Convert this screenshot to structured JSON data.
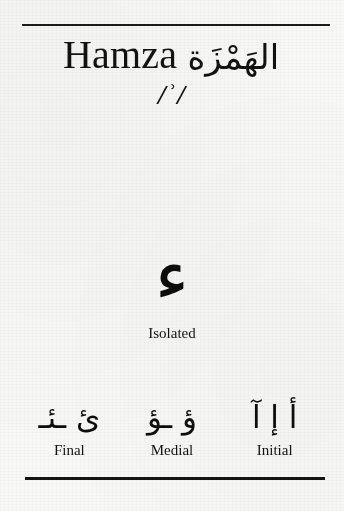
{
  "header": {
    "title_latin": "Hamza",
    "title_arabic": "الهَمْزَة",
    "phonetic": "/ʾ/"
  },
  "isolated": {
    "glyph": "ء",
    "label": "Isolated"
  },
  "forms": [
    {
      "glyphs": "ئ ـئـ",
      "label": "Final"
    },
    {
      "glyphs": "ؤ ـؤ",
      "label": "Medial"
    },
    {
      "glyphs": "أ إ آ",
      "label": "Initial"
    }
  ],
  "colors": {
    "ink": "#121212",
    "paper": "#f8f8f6",
    "rule": "#1b1b1b"
  }
}
